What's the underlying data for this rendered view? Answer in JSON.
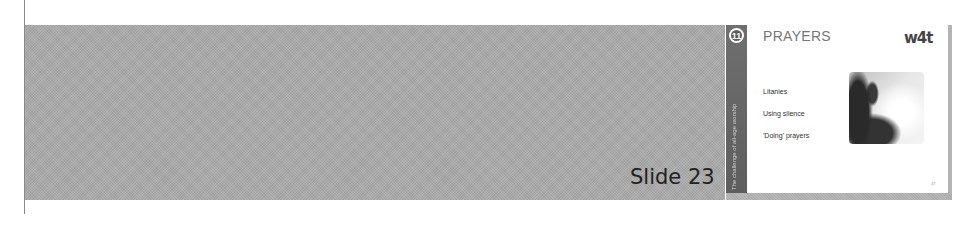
{
  "slide_label": "Slide 23",
  "thumbnail": {
    "section_number": "11",
    "sidebar_text": "The challenge of all-age worship",
    "title": "PRAYERS",
    "logo_text": "w4t",
    "bullets": [
      "Litanies",
      "Using silence",
      "'Doing' prayers"
    ],
    "page_number": "47",
    "photo_icon": "praying-hand-silhouette-icon"
  },
  "colors": {
    "band": "#a9a9a9",
    "sidebar": "#666666",
    "title": "#777777"
  }
}
